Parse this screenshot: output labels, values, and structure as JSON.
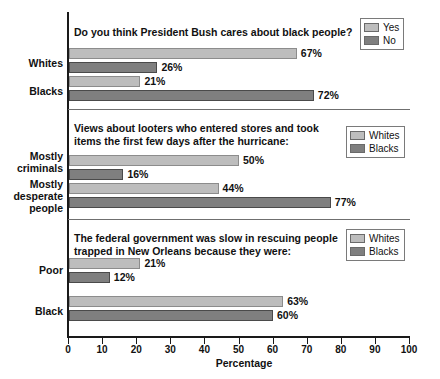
{
  "chart_data": {
    "type": "bar",
    "title": "",
    "xlabel": "Percentage",
    "ylabel": "",
    "xlim": [
      0,
      100
    ],
    "orientation": "horizontal",
    "grid": false,
    "tick_labels": [
      "0",
      "10",
      "20",
      "30",
      "40",
      "50",
      "60",
      "70",
      "80",
      "90",
      "100"
    ],
    "tick_values": [
      0,
      10,
      20,
      30,
      40,
      50,
      60,
      70,
      80,
      90,
      100
    ],
    "colors": {
      "light_series": "#bdbdbd",
      "dark_series": "#7f7f7f",
      "axis": "#1a1a1a",
      "separator": "#6f6f6f",
      "text": "#111111"
    },
    "panels": [
      {
        "id": "panel-bush-cares",
        "question": "Do you think President Bush cares about black people?",
        "legend_position": "top-right",
        "legend": [
          {
            "label": "Yes",
            "swatch": "light"
          },
          {
            "label": "No",
            "swatch": "dark"
          }
        ],
        "categories": [
          "Whites",
          "Blacks"
        ],
        "series": [
          {
            "name": "Yes",
            "swatch": "light",
            "values": [
              67,
              21
            ],
            "value_labels": [
              "67%",
              "21%"
            ]
          },
          {
            "name": "No",
            "swatch": "dark",
            "values": [
              26,
              72
            ],
            "value_labels": [
              "26%",
              "72%"
            ]
          }
        ]
      },
      {
        "id": "panel-looters",
        "question": "Views about looters who entered stores and took items the first few days after the hurricane:",
        "legend_position": "top-right",
        "legend": [
          {
            "label": "Whites",
            "swatch": "light"
          },
          {
            "label": "Blacks",
            "swatch": "dark"
          }
        ],
        "categories": [
          "Mostly criminals",
          "Mostly desperate people"
        ],
        "series": [
          {
            "name": "Whites",
            "swatch": "light",
            "values": [
              50,
              44
            ],
            "value_labels": [
              "50%",
              "44%"
            ]
          },
          {
            "name": "Blacks",
            "swatch": "dark",
            "values": [
              16,
              77
            ],
            "value_labels": [
              "16%",
              "77%"
            ]
          }
        ]
      },
      {
        "id": "panel-federal-government",
        "question": "The federal government was slow in rescuing people trapped in New Orleans because they were:",
        "legend_position": "top-right",
        "legend": [
          {
            "label": "Whites",
            "swatch": "light"
          },
          {
            "label": "Blacks",
            "swatch": "dark"
          }
        ],
        "categories": [
          "Poor",
          "Black"
        ],
        "series": [
          {
            "name": "Whites",
            "swatch": "light",
            "values": [
              21,
              63
            ],
            "value_labels": [
              "21%",
              "63%"
            ]
          },
          {
            "name": "Blacks",
            "swatch": "dark",
            "values": [
              12,
              60
            ],
            "value_labels": [
              "12%",
              "60%"
            ]
          }
        ]
      }
    ]
  },
  "layout": {
    "axis_x0": 69,
    "axis_x100": 409,
    "panel_tops": [
      12,
      110,
      220
    ],
    "panel_bottoms": [
      109,
      219,
      336
    ],
    "question_tops": [
      26,
      122,
      232
    ],
    "legend_boxes": [
      {
        "left": 360,
        "top": 18,
        "width": 50
      },
      {
        "left": 346,
        "top": 126,
        "width": 64
      },
      {
        "left": 346,
        "top": 229,
        "width": 64
      }
    ],
    "rows": [
      {
        "label_top": 57,
        "bars": [
          {
            "top": 48
          },
          {
            "top": 62
          }
        ]
      },
      {
        "label_top": 85,
        "bars": [
          {
            "top": 76
          },
          {
            "top": 90
          }
        ]
      },
      {
        "label_top": 156,
        "bars": [
          {
            "top": 155
          },
          {
            "top": 169
          }
        ]
      },
      {
        "label_top": 184,
        "bars": [
          {
            "top": 183
          },
          {
            "top": 197
          }
        ]
      },
      {
        "label_top": 264,
        "bars": [
          {
            "top": 258
          },
          {
            "top": 272
          }
        ]
      },
      {
        "label_top": 305,
        "bars": [
          {
            "top": 296
          },
          {
            "top": 310
          }
        ]
      }
    ]
  }
}
